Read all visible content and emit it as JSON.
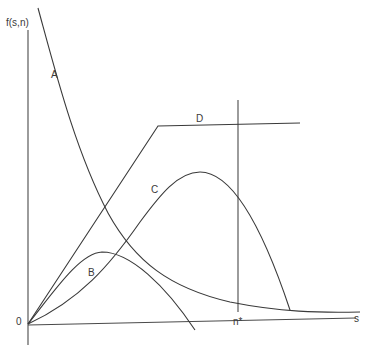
{
  "diagram": {
    "y_axis_label": "f(s,n)",
    "x_axis_label": "s",
    "origin_label": "0",
    "marker_label": "n*",
    "curves": [
      {
        "id": "A",
        "label": "A",
        "description": "decreasing convex curve from top-left, asymptotic to s-axis"
      },
      {
        "id": "B",
        "label": "B",
        "description": "small hump from origin, peaks early, falls below s-axis"
      },
      {
        "id": "C",
        "label": "C",
        "description": "S-shaped rise from origin to peak, then falls below s-axis past n*"
      },
      {
        "id": "D",
        "label": "D",
        "description": "linear rise from origin, then flat plateau"
      }
    ]
  }
}
